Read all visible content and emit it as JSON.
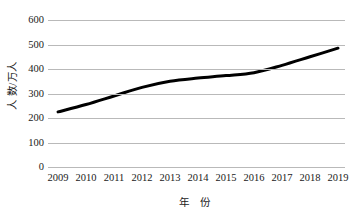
{
  "chart_data": {
    "type": "line",
    "title": "",
    "subtitle": "",
    "xlabel": "年  份",
    "ylabel": "人  数/万人",
    "x": [
      "2009",
      "2010",
      "2011",
      "2012",
      "2013",
      "2014",
      "2015",
      "2016",
      "2017",
      "2018",
      "2019"
    ],
    "categories": [
      "2009",
      "2010",
      "2011",
      "2012",
      "2013",
      "2014",
      "2015",
      "2016",
      "2017",
      "2018",
      "2019"
    ],
    "values": [
      225,
      255,
      290,
      325,
      350,
      363,
      373,
      385,
      415,
      450,
      485
    ],
    "series": [
      {
        "name": "人数/万人",
        "values": [
          225,
          255,
          290,
          325,
          350,
          363,
          373,
          385,
          415,
          450,
          485
        ]
      }
    ],
    "ylim": [
      0,
      600
    ],
    "y_ticks": [
      0,
      100,
      200,
      300,
      400,
      500,
      600
    ],
    "y_tick_labels": [
      "0",
      "100",
      "200",
      "300",
      "400",
      "500",
      "600"
    ],
    "grid": true,
    "grid_axis": "y",
    "legend": false,
    "legend_position": "none",
    "line_color": "#000000",
    "line_width": 3,
    "markers": false,
    "smooth": true,
    "gridline_color": "#b9b9b9",
    "background_color": "#ffffff",
    "axis_line_visible": false,
    "annotations": []
  },
  "axis": {
    "y_title": "人  数/万人",
    "x_title": "年  份"
  }
}
